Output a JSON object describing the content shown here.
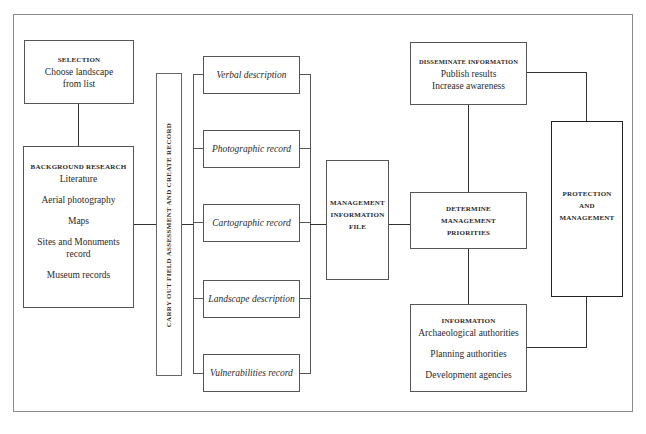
{
  "diagram": {
    "type": "flowchart",
    "selection": {
      "heading": "SELECTION",
      "lines": [
        "Choose landscape",
        "from list"
      ]
    },
    "background_research": {
      "heading": "BACKGROUND RESEARCH",
      "items": [
        "Literature",
        "Aerial photography",
        "Maps",
        "Sites and Monuments record",
        "Museum records"
      ]
    },
    "field_assessment": {
      "label": "CARRY OUT FIELD ASSESSMENT AND CREATE RECORD"
    },
    "records": [
      {
        "label": "Verbal description"
      },
      {
        "label": "Photographic record"
      },
      {
        "label": "Cartographic record"
      },
      {
        "label": "Landscape description"
      },
      {
        "label": "Vulnerabilities record"
      }
    ],
    "management_information_file": {
      "lines": [
        "MANAGEMENT",
        "INFORMATION",
        "FILE"
      ]
    },
    "disseminate": {
      "heading": "DISSEMINATE INFORMATION",
      "lines": [
        "Publish results",
        "Increase awareness"
      ]
    },
    "determine": {
      "lines": [
        "DETERMINE",
        "MANAGEMENT",
        "PRIORITIES"
      ]
    },
    "information": {
      "heading": "INFORMATION",
      "items": [
        "Archaeological authorities",
        "Planning authorities",
        "Development agencies"
      ]
    },
    "protection": {
      "lines": [
        "PROTECTION",
        "AND",
        "MANAGEMENT"
      ]
    }
  }
}
